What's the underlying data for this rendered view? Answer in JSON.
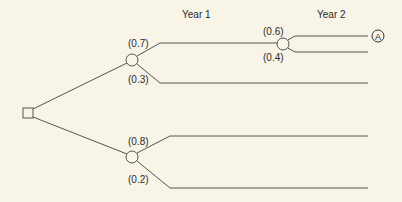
{
  "diagram": {
    "type": "decision-tree",
    "headers": {
      "year1": "Year 1",
      "year2": "Year 2"
    },
    "decision_node": {
      "shape": "square"
    },
    "chance_nodes": [
      {
        "id": "upper",
        "branches": [
          {
            "prob": "(0.7)"
          },
          {
            "prob": "(0.3)"
          }
        ]
      },
      {
        "id": "lower",
        "branches": [
          {
            "prob": "(0.8)"
          },
          {
            "prob": "(0.2)"
          }
        ]
      },
      {
        "id": "year2",
        "branches": [
          {
            "prob": "(0.6)"
          },
          {
            "prob": "(0.4)"
          }
        ]
      }
    ],
    "endpoint_label": "A"
  }
}
